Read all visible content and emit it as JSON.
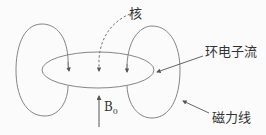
{
  "diagram": {
    "labels": {
      "nucleus": "核",
      "ring_current": "环电子流",
      "field_lines": "磁力线",
      "b0_main": "B",
      "b0_sub": "0"
    },
    "colors": {
      "line": "#777777",
      "text": "#333333",
      "background": "#fbfbfb"
    }
  }
}
